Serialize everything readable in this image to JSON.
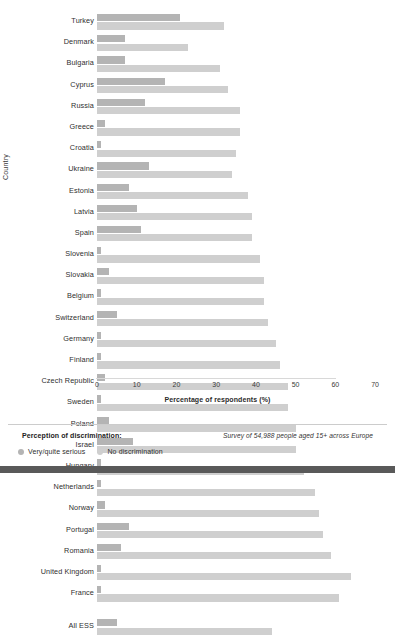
{
  "chart_data": {
    "type": "bar",
    "orientation": "horizontal",
    "title": "",
    "xlabel": "Percentage of respondents (%)",
    "ylabel": "Country",
    "xlim": [
      0,
      73
    ],
    "xticks": [
      0,
      10,
      20,
      30,
      40,
      50,
      60,
      70
    ],
    "grid": false,
    "legend_position": "bottom-left",
    "categories": [
      "Turkey",
      "Denmark",
      "Bulgaria",
      "Cyprus",
      "Russia",
      "Greece",
      "Croatia",
      "Ukraine",
      "Estonia",
      "Latvia",
      "Spain",
      "Slovenia",
      "Slovakia",
      "Belgium",
      "Switzerland",
      "Germany",
      "Finland",
      "Czech Republic",
      "Sweden",
      "Poland",
      "Israel",
      "Hungary",
      "Netherlands",
      "Norway",
      "Portugal",
      "Romania",
      "United Kingdom",
      "France"
    ],
    "total_category": "All ESS",
    "series": [
      {
        "name": "Very/quite serious",
        "color": "#b4b4b4",
        "values": [
          21,
          7,
          7,
          17,
          12,
          2,
          1,
          13,
          8,
          10,
          11,
          1,
          3,
          1,
          5,
          1,
          1,
          2,
          1,
          3,
          9,
          1,
          1,
          2,
          8,
          6,
          1,
          1
        ],
        "total_value": 5
      },
      {
        "name": "No discrimination",
        "color": "#cfcfcf",
        "values": [
          32,
          23,
          31,
          33,
          36,
          36,
          35,
          34,
          38,
          39,
          39,
          41,
          42,
          42,
          43,
          45,
          46,
          48,
          48,
          50,
          50,
          52,
          55,
          56,
          57,
          59,
          64,
          61
        ],
        "total_value": 44
      }
    ]
  },
  "legend": {
    "title": "Perception of discrimination:",
    "items": [
      {
        "label": "Very/quite serious",
        "color": "#b4b4b4"
      },
      {
        "label": "No discrimination",
        "color": "#cfcfcf"
      }
    ]
  },
  "footer": {
    "survey_note": "Survey of 54,988 people aged 15+ across Europe"
  }
}
